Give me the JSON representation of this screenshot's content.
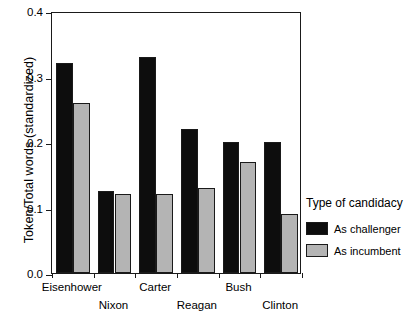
{
  "chart_data": {
    "type": "bar",
    "title": "",
    "subtitle": "",
    "xlabel": "",
    "ylabel": "Token/Total words (standardized)",
    "categories": [
      "Eisenhower",
      "Nixon",
      "Carter",
      "Reagan",
      "Bush",
      "Clinton"
    ],
    "series": [
      {
        "name": "As challenger",
        "color": "#0d0d0d",
        "values": [
          0.32,
          0.125,
          0.33,
          0.22,
          0.2,
          0.2
        ]
      },
      {
        "name": "As incumbent",
        "color": "#b4b4b4",
        "values": [
          0.26,
          0.12,
          0.12,
          0.13,
          0.17,
          0.09
        ]
      }
    ],
    "ylim": [
      0.0,
      0.4
    ],
    "yticks": [
      0.0,
      0.1,
      0.2,
      0.3,
      0.4
    ],
    "ytick_labels": [
      "0.0",
      "0.1",
      "0.2",
      "0.3",
      "0.4"
    ],
    "grid": false,
    "legend_position": "right",
    "legend_title": "Type of candidacy"
  },
  "legend": {
    "title": "Type of candidacy",
    "entries": [
      {
        "label": "As challenger",
        "color": "#0d0d0d"
      },
      {
        "label": "As incumbent",
        "color": "#b4b4b4"
      }
    ]
  },
  "axes": {
    "y_title": "Token/Total words (standardized)",
    "y_tick_labels": [
      "0.4",
      "0.3",
      "0.2",
      "0.1",
      "0.0"
    ],
    "x_tick_labels": [
      "Eisenhower",
      "Nixon",
      "Carter",
      "Reagan",
      "Bush",
      "Clinton"
    ]
  }
}
